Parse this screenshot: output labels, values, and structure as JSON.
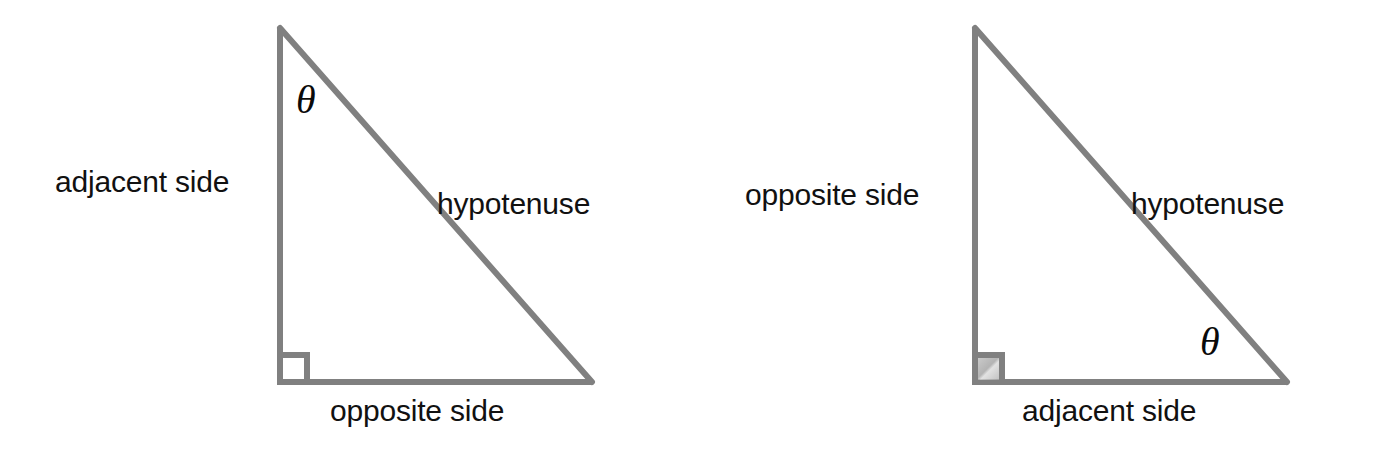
{
  "figure": {
    "type": "geometry-diagram",
    "background_color": "#ffffff",
    "stroke_color": "#808080",
    "text_color": "#111111",
    "stroke_width_px": 6
  },
  "triangles": [
    {
      "id": "left",
      "theta_position": "apex-top",
      "theta_symbol": "θ",
      "vertices": {
        "apex": [
          280,
          28
        ],
        "right_angle": [
          280,
          382
        ],
        "far": [
          592,
          382
        ]
      },
      "right_angle_marker": {
        "present": true,
        "shaded": false,
        "size_px": 26
      },
      "labels": {
        "vertical_leg": "adjacent side",
        "horizontal_leg": "opposite side",
        "slant_leg": "hypotenuse"
      }
    },
    {
      "id": "right",
      "theta_position": "bottom-right",
      "theta_symbol": "θ",
      "vertices": {
        "apex": [
          975,
          28
        ],
        "right_angle": [
          975,
          382
        ],
        "far": [
          1287,
          382
        ]
      },
      "right_angle_marker": {
        "present": true,
        "shaded": true,
        "size_px": 26
      },
      "labels": {
        "vertical_leg": "opposite side",
        "horizontal_leg": "adjacent side",
        "slant_leg": "hypotenuse"
      }
    }
  ]
}
